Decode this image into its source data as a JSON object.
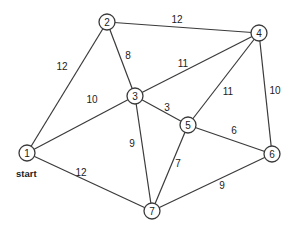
{
  "graph": {
    "title": "",
    "start_label": "start",
    "start_node": "1",
    "nodes": [
      {
        "id": "1",
        "label": "1",
        "x": 27,
        "y": 153
      },
      {
        "id": "2",
        "label": "2",
        "x": 107,
        "y": 22
      },
      {
        "id": "3",
        "label": "3",
        "x": 135,
        "y": 96
      },
      {
        "id": "4",
        "label": "4",
        "x": 259,
        "y": 33
      },
      {
        "id": "5",
        "label": "5",
        "x": 188,
        "y": 125
      },
      {
        "id": "6",
        "label": "6",
        "x": 272,
        "y": 154
      },
      {
        "id": "7",
        "label": "7",
        "x": 152,
        "y": 211
      }
    ],
    "edges": [
      {
        "from": "1",
        "to": "2",
        "weight": "12",
        "lx": 62,
        "ly": 66
      },
      {
        "from": "1",
        "to": "3",
        "weight": "10",
        "lx": 92,
        "ly": 99
      },
      {
        "from": "1",
        "to": "7",
        "weight": "12",
        "lx": 81,
        "ly": 172
      },
      {
        "from": "2",
        "to": "3",
        "weight": "8",
        "lx": 128,
        "ly": 55
      },
      {
        "from": "2",
        "to": "4",
        "weight": "12",
        "lx": 177,
        "ly": 19
      },
      {
        "from": "3",
        "to": "4",
        "weight": "11",
        "lx": 183,
        "ly": 63
      },
      {
        "from": "3",
        "to": "5",
        "weight": "3",
        "lx": 167,
        "ly": 107
      },
      {
        "from": "3",
        "to": "7",
        "weight": "9",
        "lx": 132,
        "ly": 143
      },
      {
        "from": "4",
        "to": "5",
        "weight": "11",
        "lx": 228,
        "ly": 91
      },
      {
        "from": "4",
        "to": "6",
        "weight": "10",
        "lx": 275,
        "ly": 90
      },
      {
        "from": "5",
        "to": "6",
        "weight": "6",
        "lx": 234,
        "ly": 130
      },
      {
        "from": "5",
        "to": "7",
        "weight": "7",
        "lx": 178,
        "ly": 163
      },
      {
        "from": "6",
        "to": "7",
        "weight": "9",
        "lx": 222,
        "ly": 185
      }
    ]
  }
}
